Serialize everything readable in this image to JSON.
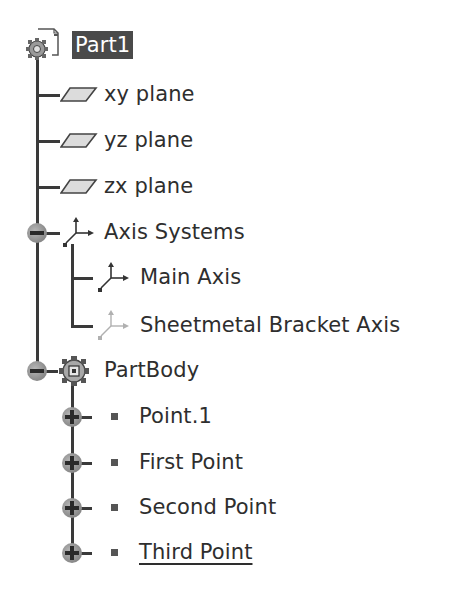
{
  "tree": {
    "root": {
      "label": "Part1",
      "icon": "part-gear-document-icon",
      "selected": true
    },
    "planes": [
      {
        "label": "xy plane",
        "icon": "plane-icon"
      },
      {
        "label": "yz plane",
        "icon": "plane-icon"
      },
      {
        "label": "zx plane",
        "icon": "plane-icon"
      }
    ],
    "axis_systems": {
      "label": "Axis Systems",
      "icon": "axis-system-icon",
      "expanded": true,
      "toggle": "collapse-minus",
      "children": [
        {
          "label": "Main Axis",
          "icon": "axis-system-icon"
        },
        {
          "label": "Sheetmetal Bracket Axis",
          "icon": "axis-system-faded-icon"
        }
      ]
    },
    "part_body": {
      "label": "PartBody",
      "icon": "body-gear-icon",
      "expanded": true,
      "toggle": "collapse-minus",
      "children": [
        {
          "label": "Point.1",
          "icon": "point-icon",
          "toggle": "expand-plus"
        },
        {
          "label": "First Point",
          "icon": "point-icon",
          "toggle": "expand-plus"
        },
        {
          "label": "Second Point",
          "icon": "point-icon",
          "toggle": "expand-plus"
        },
        {
          "label": "Third Point",
          "icon": "point-icon",
          "toggle": "expand-plus",
          "underlined": true
        }
      ]
    }
  },
  "colors": {
    "selection_bg": "#4a4a4a",
    "selection_text": "#ffffff",
    "line": "#3a3a3a",
    "text": "#2e2e2e"
  }
}
